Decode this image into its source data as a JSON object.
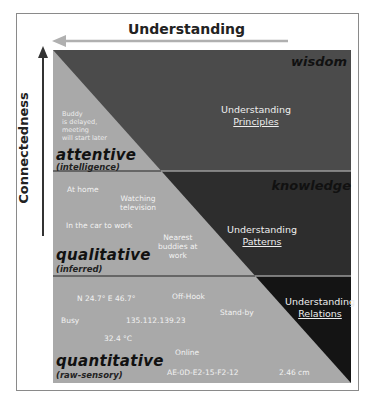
{
  "axes": {
    "horizontal_label": "Understanding",
    "vertical_label": "Connectedness"
  },
  "levels": [
    {
      "name": "wisdom",
      "understanding_line1": "Understanding",
      "understanding_line2": "Principles"
    },
    {
      "name": "knowledge",
      "understanding_line1": "Understanding",
      "understanding_line2": "Patterns"
    },
    {
      "name": "",
      "understanding_line1": "Understanding",
      "understanding_line2": "Relations"
    }
  ],
  "categories": [
    {
      "title": "attentive",
      "subtitle": "(intelligence)",
      "examples": [
        "Buddy is delayed, meeting will start later"
      ],
      "example_lines": [
        "Buddy",
        "is delayed,",
        "meeting",
        "will start later"
      ]
    },
    {
      "title": "qualitative",
      "subtitle": "(inferred)",
      "examples": [
        "At home",
        "Watching television",
        "In the car to work",
        "Nearest buddies at work"
      ],
      "watching_lines": [
        "Watching",
        "television"
      ],
      "nearest_lines": [
        "Nearest",
        "buddies at",
        "work"
      ]
    },
    {
      "title": "quantitative",
      "subtitle": "(raw-sensory)",
      "examples": [
        "N 24.7° E 46.7°",
        "Off-Hook",
        "Busy",
        "135.112.139.23",
        "Stand-by",
        "32.4 °C",
        "Online",
        "AE-0D-E2-15-F2-12",
        "2.46 cm"
      ]
    }
  ],
  "colors": {
    "band_wisdom": "#4b4b4b",
    "band_knowledge": "#2d2d2d",
    "band_relations": "#141414",
    "triangle": "#a9a9a9",
    "divider": "#9a9a9a"
  }
}
